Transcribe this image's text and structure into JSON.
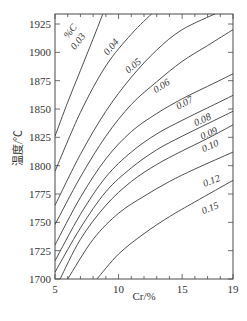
{
  "chart_data": {
    "type": "line",
    "title": "",
    "xlabel": "Cr/%",
    "ylabel": "温度/℃",
    "xlim": [
      5,
      19
    ],
    "ylim": [
      1700,
      1935
    ],
    "x_ticks": [
      5,
      10,
      15,
      19
    ],
    "y_ticks": [
      1700,
      1725,
      1750,
      1775,
      1800,
      1825,
      1850,
      1875,
      1900,
      1925
    ],
    "grid": false,
    "legend": "inline curve labels",
    "series_label_header": "%C",
    "series": [
      {
        "name": "0.03",
        "points": [
          [
            5,
            1826
          ],
          [
            6,
            1856
          ],
          [
            7,
            1884
          ],
          [
            8,
            1912
          ],
          [
            8.8,
            1935
          ]
        ]
      },
      {
        "name": "0.04",
        "points": [
          [
            5,
            1795
          ],
          [
            7,
            1847
          ],
          [
            9,
            1888
          ],
          [
            11,
            1916
          ],
          [
            12.7,
            1935
          ]
        ]
      },
      {
        "name": "0.05",
        "points": [
          [
            5,
            1765
          ],
          [
            7,
            1810
          ],
          [
            9,
            1848
          ],
          [
            11,
            1878
          ],
          [
            13,
            1902
          ],
          [
            15,
            1920
          ],
          [
            17.8,
            1935
          ]
        ]
      },
      {
        "name": "0.06",
        "points": [
          [
            5,
            1748
          ],
          [
            7,
            1790
          ],
          [
            9,
            1826
          ],
          [
            11,
            1854
          ],
          [
            13,
            1874
          ],
          [
            15,
            1892
          ],
          [
            17,
            1906
          ],
          [
            19,
            1920
          ]
        ]
      },
      {
        "name": "0.07",
        "points": [
          [
            5,
            1730
          ],
          [
            7,
            1772
          ],
          [
            9,
            1806
          ],
          [
            11,
            1830
          ],
          [
            13,
            1846
          ],
          [
            15,
            1859
          ],
          [
            17,
            1870
          ],
          [
            19,
            1881
          ]
        ]
      },
      {
        "name": "0.08",
        "points": [
          [
            5,
            1716
          ],
          [
            7,
            1757
          ],
          [
            9,
            1790
          ],
          [
            11,
            1812
          ],
          [
            13,
            1828
          ],
          [
            15,
            1840
          ],
          [
            17,
            1851
          ],
          [
            19,
            1862
          ]
        ]
      },
      {
        "name": "0.09",
        "points": [
          [
            5,
            1706
          ],
          [
            7,
            1745
          ],
          [
            9,
            1777
          ],
          [
            11,
            1798
          ],
          [
            13,
            1814
          ],
          [
            15,
            1826
          ],
          [
            17,
            1837
          ],
          [
            19,
            1848
          ]
        ]
      },
      {
        "name": "0.10",
        "points": [
          [
            5.4,
            1700
          ],
          [
            7,
            1735
          ],
          [
            9,
            1765
          ],
          [
            11,
            1786
          ],
          [
            13,
            1801
          ],
          [
            15,
            1813
          ],
          [
            17,
            1824
          ],
          [
            19,
            1836
          ]
        ]
      },
      {
        "name": "0.12",
        "points": [
          [
            6.0,
            1700
          ],
          [
            8,
            1735
          ],
          [
            10,
            1758
          ],
          [
            12,
            1773
          ],
          [
            14,
            1786
          ],
          [
            16,
            1797
          ],
          [
            19,
            1812
          ]
        ]
      },
      {
        "name": "0.15",
        "points": [
          [
            8.3,
            1700
          ],
          [
            10,
            1722
          ],
          [
            12,
            1740
          ],
          [
            14,
            1755
          ],
          [
            16,
            1768
          ],
          [
            19,
            1787
          ]
        ]
      }
    ],
    "curve_labels": [
      {
        "text": "%C",
        "x": 6.4,
        "y": 1917,
        "angle": 52
      },
      {
        "text": "0.03",
        "x": 7.0,
        "y": 1908,
        "angle": 52
      },
      {
        "text": "0.04",
        "x": 9.6,
        "y": 1903,
        "angle": 50
      },
      {
        "text": "0.05",
        "x": 11.3,
        "y": 1886,
        "angle": 40
      },
      {
        "text": "0.06",
        "x": 13.5,
        "y": 1868,
        "angle": 32
      },
      {
        "text": "0.07",
        "x": 15.3,
        "y": 1853,
        "angle": 28
      },
      {
        "text": "0.08",
        "x": 16.7,
        "y": 1838,
        "angle": 25
      },
      {
        "text": "0.09",
        "x": 17.2,
        "y": 1826,
        "angle": 24
      },
      {
        "text": "0.10",
        "x": 17.3,
        "y": 1815,
        "angle": 24
      },
      {
        "text": "0.12",
        "x": 17.4,
        "y": 1784,
        "angle": 22
      },
      {
        "text": "0.15",
        "x": 17.3,
        "y": 1760,
        "angle": 22
      }
    ]
  },
  "axes": {
    "x_label": "Cr/%",
    "y_label": "温度/℃"
  }
}
